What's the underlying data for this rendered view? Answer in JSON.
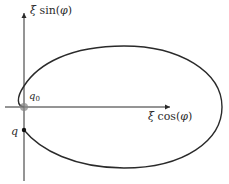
{
  "diagram": {
    "axes": {
      "x_label": "ξ cos(φ)",
      "y_label": "ξ sin(φ)",
      "x_label_parts": {
        "xi": "ξ",
        "func": " cos(",
        "arg": "φ",
        "close": ")"
      },
      "y_label_parts": {
        "xi": "ξ",
        "func": " sin(",
        "arg": "φ",
        "close": ")"
      }
    },
    "points": [
      {
        "id": "q0",
        "label_base": "q",
        "label_sub": "0",
        "color": "#8a8a8a",
        "description": "origin point (gray)"
      },
      {
        "id": "q",
        "label_base": "q",
        "label_sub": "",
        "color": "#111111",
        "description": "starting point on negative vertical axis"
      }
    ],
    "curve": {
      "description": "closed-like elliptical trajectory from q around to q0",
      "stroke": "#2a2a2a"
    },
    "colors": {
      "axis": "#2a2a2a",
      "curve": "#2a2a2a",
      "origin_dot": "#8a8a8a",
      "q_dot": "#111111",
      "background": "#ffffff"
    }
  }
}
